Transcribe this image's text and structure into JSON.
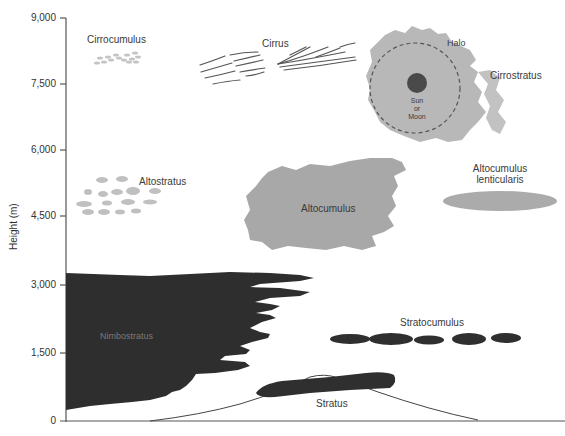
{
  "figure": {
    "y_axis": {
      "label": "Height (m)",
      "ticks": [
        "9,000",
        "7,500",
        "6,000",
        "4,500",
        "3,000",
        "1,500",
        "0"
      ]
    },
    "clouds": {
      "cirrocumulus": "Cirrocumulus",
      "cirrus": "Cirrus",
      "halo": "Halo",
      "sun_moon_1": "Sun",
      "sun_moon_2": "or",
      "sun_moon_3": "Moon",
      "cirrostratus": "Cirrostratus",
      "altostratus": "Altostratus",
      "altocumulus": "Altocumulus",
      "altocumulus_lenticularis_1": "Altocumulus",
      "altocumulus_lenticularis_2": "lenticularis",
      "nimbostratus": "Nimbostratus",
      "stratocumulus": "Stratocumulus",
      "stratus": "Stratus"
    },
    "colors": {
      "light_cloud": "#bdbdbd",
      "mid_cloud": "#a9a9a9",
      "dark_cloud": "#2f2f2f",
      "axis": "#555555",
      "sun": "#4a4a4a"
    }
  }
}
